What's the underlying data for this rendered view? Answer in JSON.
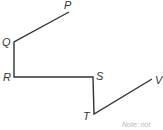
{
  "diagram": {
    "points": [
      {
        "name": "P",
        "x": 69,
        "y": 12
      },
      {
        "name": "Q",
        "x": 14,
        "y": 42
      },
      {
        "name": "R",
        "x": 14,
        "y": 77
      },
      {
        "name": "S",
        "x": 93,
        "y": 77
      },
      {
        "name": "T",
        "x": 94,
        "y": 114
      },
      {
        "name": "V",
        "x": 152,
        "y": 79
      }
    ],
    "labels": {
      "P": "P",
      "Q": "Q",
      "R": "R",
      "S": "S",
      "T": "T",
      "V": "V"
    },
    "path_points": "69,12 14,42 14,77 93,77 94,114 152,79",
    "line_color": "#333333",
    "note": "Note: not"
  }
}
